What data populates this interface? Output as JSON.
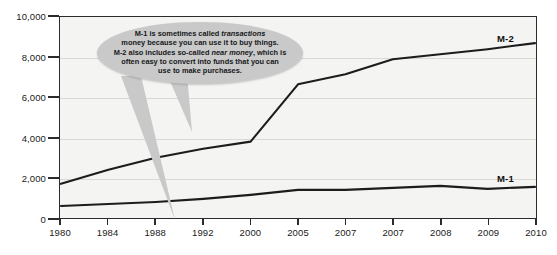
{
  "chart_data": {
    "type": "line",
    "title": "",
    "xlabel": "",
    "ylabel": "",
    "ylim": [
      0,
      10000
    ],
    "yticks": [
      0,
      2000,
      4000,
      6000,
      8000,
      10000
    ],
    "ytick_labels": [
      "0",
      "2,000",
      "4,000",
      "6,000",
      "8,000",
      "10,000"
    ],
    "grid": true,
    "legend_position": "inline-right",
    "categories": [
      "1980",
      "1984",
      "1988",
      "1992",
      "2000",
      "2005",
      "2007",
      "2007",
      "2008",
      "2009",
      "2010"
    ],
    "series": [
      {
        "name": "M-2",
        "label": "M-2",
        "color": "#1c1c1c",
        "values": [
          1700,
          2400,
          3000,
          3450,
          3800,
          6650,
          7150,
          7900,
          8150,
          8400,
          8700
        ]
      },
      {
        "name": "M-1",
        "label": "M-1",
        "color": "#1c1c1c",
        "values": [
          600,
          700,
          800,
          950,
          1150,
          1400,
          1400,
          1500,
          1600,
          1450,
          1550
        ]
      }
    ],
    "annotations": [
      {
        "name": "money-definition-callout",
        "text_lines": [
          "M-1 is sometimes called transactions",
          "money because you can use it to buy things.",
          "M-2 also includes so-called near money, which is",
          "often easy to convert into funds that you can",
          "use to make purchases."
        ],
        "italic_terms": [
          "transactions",
          "near money"
        ],
        "points_to": [
          "M-2",
          "M-1"
        ],
        "background_color": "#c9c9c9"
      }
    ]
  },
  "axis": {
    "y_labels": [
      "10,000",
      "8,000",
      "6,000",
      "4,000",
      "2,000",
      "0"
    ],
    "x_labels": [
      "1980",
      "1984",
      "1988",
      "1992",
      "2000",
      "2005",
      "2007",
      "2007",
      "2008",
      "2009",
      "2010"
    ]
  },
  "callout": {
    "line1_a": "M-1 is sometimes called ",
    "line1_b": "transactions",
    "line2": "money because you can use it to buy things.",
    "line3_a": "M-2 also includes so-called ",
    "line3_b": "near money",
    "line3_c": ", which is",
    "line4": "often easy to convert into funds that you can",
    "line5": "use to make purchases."
  },
  "series_labels": {
    "m2": "M-2",
    "m1": "M-1"
  }
}
